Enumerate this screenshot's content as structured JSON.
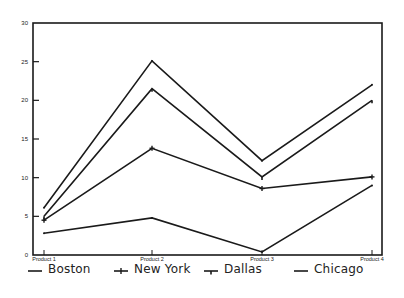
{
  "chart_data": {
    "type": "line",
    "title": "",
    "xlabel": "",
    "ylabel": "",
    "categories": [
      "Product 1",
      "Product 2",
      "Product 3",
      "Product 4"
    ],
    "ylim": [
      0,
      30
    ],
    "yticks": [
      0,
      5,
      10,
      15,
      20,
      25,
      30
    ],
    "grid": false,
    "legend_position": "bottom",
    "series": [
      {
        "name": "Boston",
        "marker": "none",
        "values": [
          6.1,
          25.1,
          12.2,
          22.0
        ]
      },
      {
        "name": "New York",
        "marker": "plus",
        "values": [
          4.5,
          13.8,
          8.6,
          10.1
        ]
      },
      {
        "name": "Dallas",
        "marker": "down-tick",
        "values": [
          5.0,
          21.5,
          10.1,
          20.0
        ]
      },
      {
        "name": "Chicago",
        "marker": "none",
        "values": [
          2.8,
          4.8,
          0.4,
          9.0
        ]
      }
    ],
    "line_color": "#1a1a1a"
  },
  "legend": {
    "items": [
      {
        "label": "Boston",
        "x": 28
      },
      {
        "label": "New York",
        "x": 114
      },
      {
        "label": "Dallas",
        "x": 204
      },
      {
        "label": "Chicago",
        "x": 294
      }
    ]
  }
}
